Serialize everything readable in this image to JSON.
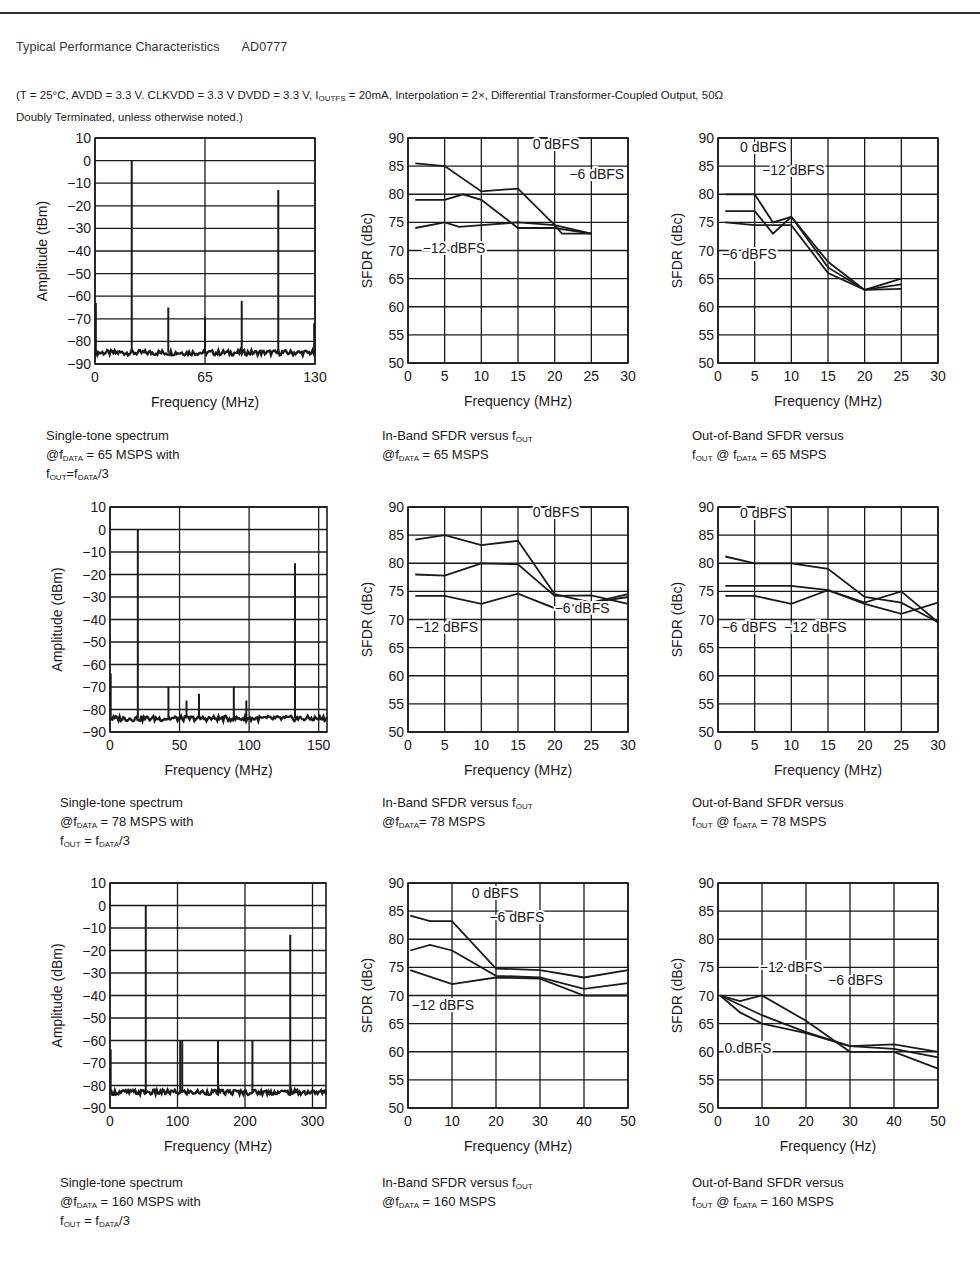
{
  "header": {
    "title": "Typical Performance Characteristics",
    "part_number": "AD0777",
    "conditions_line1": "(T = 25°C, AVDD = 3.3 V. CLKVDD = 3.3 V DVDD = 3.3 V, I",
    "conditions_sub": "OUTFS",
    "conditions_line1_rest": " = 20mA, Interpolation = 2×, Differential Transformer-Coupled Output, 50Ω",
    "conditions_line2": "Doubly Terminated, unless otherwise noted.)"
  },
  "captions": [
    {
      "lines": [
        [
          "Single-tone spectrum"
        ],
        [
          "@f",
          {
            "sub": "DATA"
          },
          " = 65 MSPS with"
        ],
        [
          "f",
          {
            "sub": "OUT"
          },
          "=f",
          {
            "sub": "DATA"
          },
          "/3"
        ]
      ]
    },
    {
      "lines": [
        [
          "In-Band SFDR versus f",
          {
            "sub": "OUT"
          }
        ],
        [
          "@f",
          {
            "sub": "DATA"
          },
          " = 65 MSPS"
        ]
      ]
    },
    {
      "lines": [
        [
          "Out-of-Band SFDR versus"
        ],
        [
          "f",
          {
            "sub": "OUT"
          },
          " @ f",
          {
            "sub": "DATA"
          },
          " = 65 MSPS"
        ]
      ]
    },
    {
      "lines": [
        [
          "Single-tone spectrum"
        ],
        [
          "@f",
          {
            "sub": "DATA"
          },
          " = 78 MSPS with"
        ],
        [
          "f",
          {
            "sub": "OUT"
          },
          " = f",
          {
            "sub": "DATA"
          },
          "/3"
        ]
      ]
    },
    {
      "lines": [
        [
          "In-Band SFDR versus f",
          {
            "sub": "OUT"
          }
        ],
        [
          "@f",
          {
            "sub": "DATA"
          },
          "= 78 MSPS"
        ]
      ]
    },
    {
      "lines": [
        [
          "Out-of-Band SFDR versus"
        ],
        [
          "f",
          {
            "sub": "OUT"
          },
          " @ f",
          {
            "sub": "DATA"
          },
          " = 78 MSPS"
        ]
      ]
    },
    {
      "lines": [
        [
          "Single-tone spectrum"
        ],
        [
          "@f",
          {
            "sub": "DATA"
          },
          " = 160 MSPS with"
        ],
        [
          "f",
          {
            "sub": "OUT"
          },
          " =  f",
          {
            "sub": "DATA"
          },
          "/3"
        ]
      ]
    },
    {
      "lines": [
        [
          "In-Band SFDR versus f",
          {
            "sub": "OUT"
          }
        ],
        [
          "@f",
          {
            "sub": "DATA"
          },
          " = 160 MSPS"
        ]
      ]
    },
    {
      "lines": [
        [
          "Out-of-Band SFDR versus"
        ],
        [
          "f",
          {
            "sub": "OUT"
          },
          " @ f",
          {
            "sub": "DATA"
          },
          " = 160 MSPS"
        ]
      ]
    }
  ],
  "chart_data": [
    {
      "id": "spectrum-65",
      "type": "spectrum",
      "title": "Single-tone spectrum @fDATA = 65 MSPS with fOUT=fDATA/3",
      "xlabel": "Frequency (MHz)",
      "ylabel": "Amplitude (tBm)",
      "xlim": [
        0,
        130
      ],
      "ylim": [
        -90,
        10
      ],
      "xticks": [
        0,
        65,
        130
      ],
      "xtick_labels": [
        "0",
        "65",
        "130"
      ],
      "yticks": [
        10,
        0,
        -10,
        -20,
        -30,
        -40,
        -50,
        -60,
        -70,
        -80,
        -90
      ],
      "ytick_labels": [
        "10",
        "0",
        "−10",
        "−20",
        "−30",
        "−40",
        "−50",
        "−60",
        "−70",
        "−80",
        "−90"
      ],
      "noise_floor": -85,
      "peaks": [
        {
          "x": 0.5,
          "y": -63
        },
        {
          "x": 21.7,
          "y": 0
        },
        {
          "x": 43.3,
          "y": -65
        },
        {
          "x": 65,
          "y": -69
        },
        {
          "x": 86.7,
          "y": -62
        },
        {
          "x": 108.3,
          "y": -13
        },
        {
          "x": 129.5,
          "y": -72
        }
      ],
      "grid": true
    },
    {
      "id": "inband-65",
      "type": "line",
      "title": "In-Band SFDR versus fOUT @fDATA = 65 MSPS",
      "xlabel": "Frequency (MHz)",
      "ylabel": "SFDR (dBc)",
      "xlim": [
        0,
        30
      ],
      "ylim": [
        50,
        90
      ],
      "xticks": [
        0,
        5,
        10,
        15,
        20,
        25,
        30
      ],
      "yticks": [
        90,
        85,
        80,
        75,
        70,
        65,
        60,
        55,
        50
      ],
      "series": [
        {
          "name": "0 dBFS",
          "x": [
            1,
            5,
            10,
            15,
            20,
            21,
            25
          ],
          "y": [
            85.5,
            85,
            80.5,
            81,
            74.5,
            73,
            73
          ]
        },
        {
          "name": "−6 dBFS",
          "x": [
            1,
            5,
            7.5,
            10,
            15,
            20,
            25
          ],
          "y": [
            79,
            79,
            80,
            79,
            74,
            74,
            73
          ]
        },
        {
          "name": "−12 dBFS",
          "x": [
            1,
            5,
            7,
            10,
            15,
            20,
            25
          ],
          "y": [
            74,
            75,
            74.2,
            74.5,
            75,
            74.5,
            73
          ]
        }
      ],
      "annotations": [
        {
          "text": "0 dBFS",
          "x": 17,
          "y": 88
        },
        {
          "text": "−6 dBFS",
          "x": 22,
          "y": 82.8
        },
        {
          "text": "−12 dBFS",
          "x": 2,
          "y": 69.5
        }
      ],
      "grid": true
    },
    {
      "id": "outband-65",
      "type": "line",
      "title": "Out-of-Band SFDR versus fOUT @ fDATA = 65 MSPS",
      "xlabel": "Frequency (MHz)",
      "ylabel": "SFDR (dBc)",
      "xlim": [
        0,
        30
      ],
      "ylim": [
        50,
        90
      ],
      "xticks": [
        0,
        5,
        10,
        15,
        20,
        25,
        30
      ],
      "yticks": [
        90,
        85,
        80,
        75,
        70,
        65,
        60,
        55,
        50
      ],
      "series": [
        {
          "name": "0 dBFS",
          "x": [
            1,
            5,
            7.5,
            10,
            15,
            20,
            25
          ],
          "y": [
            80,
            80,
            75,
            76,
            68,
            63,
            65
          ]
        },
        {
          "name": "−12 dBFS",
          "x": [
            1,
            5,
            7.5,
            10,
            15,
            20,
            25
          ],
          "y": [
            77,
            77,
            73,
            76,
            67,
            63,
            64
          ]
        },
        {
          "name": "−6 dBFS",
          "x": [
            1,
            5,
            10,
            15,
            20,
            25
          ],
          "y": [
            75,
            74.5,
            74.5,
            66,
            63,
            63.2
          ]
        }
      ],
      "annotations": [
        {
          "text": "0 dBFS",
          "x": 3,
          "y": 87.5
        },
        {
          "text": "−12 dBFS",
          "x": 6,
          "y": 83.5
        },
        {
          "text": "−6 dBFS",
          "x": 0.5,
          "y": 68.5
        }
      ],
      "grid": true
    },
    {
      "id": "spectrum-78",
      "type": "spectrum",
      "title": "Single-tone spectrum @fDATA = 78 MSPS with fOUT = fDATA/3",
      "xlabel": "Frequency (MHz)",
      "ylabel": "Amplitude (dBm)",
      "xlim": [
        0,
        156
      ],
      "ylim": [
        -90,
        10
      ],
      "xticks": [
        0,
        50,
        100,
        150
      ],
      "xtick_labels": [
        "0",
        "50",
        "100",
        "150"
      ],
      "yticks": [
        10,
        0,
        -10,
        -20,
        -30,
        -40,
        -50,
        -60,
        -70,
        -80,
        -90
      ],
      "ytick_labels": [
        "10",
        "0",
        "−10",
        "−20",
        "−30",
        "−40",
        "−50",
        "−60",
        "−70",
        "−80",
        "−90"
      ],
      "noise_floor": -84,
      "peaks": [
        {
          "x": 0.5,
          "y": -64
        },
        {
          "x": 20,
          "y": 0
        },
        {
          "x": 42,
          "y": -70
        },
        {
          "x": 55,
          "y": -76
        },
        {
          "x": 64,
          "y": -73
        },
        {
          "x": 89,
          "y": -70
        },
        {
          "x": 98,
          "y": -76
        },
        {
          "x": 133,
          "y": -15
        }
      ],
      "grid": true
    },
    {
      "id": "inband-78",
      "type": "line",
      "title": "In-Band SFDR versus fOUT @fDATA= 78 MSPS",
      "xlabel": "Frequency (MHz)",
      "ylabel": "SFDR (dBc)",
      "xlim": [
        0,
        30
      ],
      "ylim": [
        50,
        90
      ],
      "xticks": [
        0,
        5,
        10,
        15,
        20,
        25,
        30
      ],
      "yticks": [
        90,
        85,
        80,
        75,
        70,
        65,
        60,
        55,
        50
      ],
      "series": [
        {
          "name": "0 dBFS",
          "x": [
            1,
            5,
            10,
            15,
            20,
            25,
            30
          ],
          "y": [
            84.2,
            85,
            83.2,
            84,
            74.5,
            73,
            74.5
          ]
        },
        {
          "name": "−6 dBFS",
          "x": [
            1,
            5,
            10,
            15,
            20,
            25,
            30
          ],
          "y": [
            78,
            77.8,
            80,
            79.8,
            74.2,
            74.3,
            72.8
          ]
        },
        {
          "name": "−12 dBFS",
          "x": [
            1,
            5,
            10,
            15,
            20,
            25,
            30
          ],
          "y": [
            74.2,
            74.2,
            72.8,
            74.6,
            72,
            73,
            74
          ]
        }
      ],
      "annotations": [
        {
          "text": "0 dBFS",
          "x": 17,
          "y": 88.3
        },
        {
          "text": "−6 dBFS",
          "x": 20,
          "y": 71.2
        },
        {
          "text": "−12 dBFS",
          "x": 1,
          "y": 67.8
        }
      ],
      "grid": true
    },
    {
      "id": "outband-78",
      "type": "line",
      "title": "Out-of-Band SFDR versus fOUT @ fDATA = 78 MSPS",
      "xlabel": "Frequency (MHz)",
      "ylabel": "SFDR (dBc)",
      "xlim": [
        0,
        30
      ],
      "ylim": [
        50,
        90
      ],
      "xticks": [
        0,
        5,
        10,
        15,
        20,
        25,
        30
      ],
      "yticks": [
        90,
        85,
        80,
        75,
        70,
        65,
        60,
        55,
        50
      ],
      "series": [
        {
          "name": "0 dBFS",
          "x": [
            1,
            5,
            10,
            15,
            20,
            25,
            30
          ],
          "y": [
            81.2,
            80,
            80,
            79,
            74,
            73,
            69.5
          ]
        },
        {
          "name": "−6 dBFS",
          "x": [
            1,
            5,
            10,
            15,
            20,
            25,
            30
          ],
          "y": [
            74.2,
            74.2,
            72.8,
            75.2,
            73,
            75,
            69.5
          ]
        },
        {
          "name": "−12 dBFS",
          "x": [
            1,
            5,
            10,
            15,
            20,
            25,
            30
          ],
          "y": [
            76,
            76,
            76,
            75.2,
            72.8,
            71,
            73
          ]
        }
      ],
      "annotations": [
        {
          "text": "0 dBFS",
          "x": 3,
          "y": 88
        },
        {
          "text": "−6 dBFS",
          "x": 0.5,
          "y": 67.8
        },
        {
          "text": "−12 dBFS",
          "x": 9,
          "y": 67.8
        }
      ],
      "grid": true
    },
    {
      "id": "spectrum-160",
      "type": "spectrum",
      "title": "Single-tone spectrum @fDATA = 160 MSPS with fOUT = fDATA/3",
      "xlabel": "Frequency (MHz)",
      "ylabel": "Amplitude (dBm)",
      "xlim": [
        0,
        320
      ],
      "ylim": [
        -90,
        10
      ],
      "xticks": [
        0,
        100,
        200,
        300
      ],
      "xtick_labels": [
        "0",
        "100",
        "200",
        "300"
      ],
      "yticks": [
        10,
        0,
        -10,
        -20,
        -30,
        -40,
        -50,
        -60,
        -70,
        -80,
        -90
      ],
      "ytick_labels": [
        "10",
        "0",
        "−10",
        "−20",
        "−30",
        "−40",
        "−50",
        "−60",
        "−70",
        "−80",
        "−90"
      ],
      "noise_floor": -83,
      "peaks": [
        {
          "x": 1,
          "y": -64
        },
        {
          "x": 53,
          "y": 0
        },
        {
          "x": 104,
          "y": -60
        },
        {
          "x": 107,
          "y": -60
        },
        {
          "x": 160,
          "y": -60
        },
        {
          "x": 211,
          "y": -60
        },
        {
          "x": 267,
          "y": -13
        }
      ],
      "grid": true
    },
    {
      "id": "inband-160",
      "type": "line",
      "title": "In-Band SFDR versus fOUT @fDATA = 160 MSPS",
      "xlabel": "Frequency (MHz)",
      "ylabel": "SFDR (dBc)",
      "xlim": [
        0,
        50
      ],
      "ylim": [
        50,
        90
      ],
      "xticks": [
        0,
        10,
        20,
        30,
        40,
        50
      ],
      "yticks": [
        90,
        85,
        80,
        75,
        70,
        65,
        60,
        55,
        50
      ],
      "series": [
        {
          "name": "0 dBFS",
          "x": [
            0.5,
            5,
            10,
            20,
            30,
            40,
            50
          ],
          "y": [
            84.2,
            83.2,
            83.2,
            74.8,
            74.5,
            73.2,
            74.5
          ]
        },
        {
          "name": "−6 dBFS",
          "x": [
            0.5,
            5,
            10,
            20,
            30,
            40,
            50
          ],
          "y": [
            78,
            79,
            78,
            73.5,
            73.2,
            71.2,
            72.2
          ]
        },
        {
          "name": "−12 dBFS",
          "x": [
            0.5,
            10,
            20,
            30,
            40,
            50
          ],
          "y": [
            74.5,
            72,
            73.2,
            73,
            70,
            70
          ]
        }
      ],
      "annotations": [
        {
          "text": "0 dBFS",
          "x": 14.5,
          "y": 87.4
        },
        {
          "text": "−6 dBFS",
          "x": 18.5,
          "y": 83
        },
        {
          "text": "−12 dBFS",
          "x": 0.8,
          "y": 67.5
        }
      ],
      "grid": true
    },
    {
      "id": "outband-160",
      "type": "line",
      "title": "Out-of-Band SFDR versus fOUT @ fDATA = 160 MSPS",
      "xlabel": "Frequency (Hz)",
      "ylabel": "SFDR (dBc)",
      "xlim": [
        0,
        50
      ],
      "ylim": [
        50,
        90
      ],
      "xticks": [
        0,
        10,
        20,
        30,
        40,
        50
      ],
      "yticks": [
        90,
        85,
        80,
        75,
        70,
        65,
        60,
        55,
        50
      ],
      "series": [
        {
          "name": "0 dBFS",
          "x": [
            0.5,
            5,
            10,
            20,
            30,
            40,
            50
          ],
          "y": [
            70,
            67,
            65,
            63.3,
            61,
            61.3,
            60
          ]
        },
        {
          "name": "−6 dBFS",
          "x": [
            0.5,
            10,
            20,
            30,
            40,
            50
          ],
          "y": [
            70,
            66.5,
            63.5,
            61,
            60.5,
            59
          ]
        },
        {
          "name": "−12 dBFS",
          "x": [
            0.5,
            5,
            10,
            20,
            30,
            40,
            50
          ],
          "y": [
            70,
            69,
            70,
            65.5,
            60,
            60,
            57
          ]
        }
      ],
      "annotations": [
        {
          "text": "−12 dBFS",
          "x": 9.5,
          "y": 74.2
        },
        {
          "text": "−6 dBFS",
          "x": 25,
          "y": 71.8
        },
        {
          "text": "0 dBFS",
          "x": 1.5,
          "y": 59.8
        }
      ],
      "grid": true
    }
  ],
  "colors": {
    "ink": "#1a1a1a",
    "grid": "#1a1a1a",
    "background": "#ffffff"
  }
}
